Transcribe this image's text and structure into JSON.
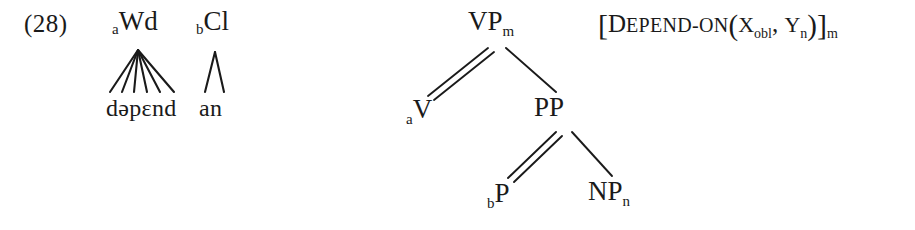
{
  "example": {
    "number_label": "(28)"
  },
  "prosodic_structure": {
    "nodes": [
      {
        "name": "wd",
        "prefix_subscript": "a",
        "label": "Wd",
        "dominates": "depend"
      },
      {
        "name": "cl",
        "prefix_subscript": "b",
        "label": "Cl",
        "dominates": "an"
      }
    ],
    "segment_strings": [
      {
        "name": "depend",
        "text": "dəpɛnd",
        "segments": [
          "d",
          "ə",
          "p",
          "ɛ",
          "n",
          "d"
        ],
        "line_count": 6
      },
      {
        "name": "an",
        "text": "an",
        "segments": [
          "a",
          "n"
        ],
        "line_count": 2
      }
    ]
  },
  "syntax_tree": {
    "nodes": [
      {
        "id": "vp",
        "prefix_subscript": "",
        "label": "VP",
        "subscript": "m"
      },
      {
        "id": "v",
        "prefix_subscript": "a",
        "label": "V",
        "subscript": ""
      },
      {
        "id": "pp",
        "prefix_subscript": "",
        "label": "PP",
        "subscript": ""
      },
      {
        "id": "p",
        "prefix_subscript": "b",
        "label": "P",
        "subscript": ""
      },
      {
        "id": "np",
        "prefix_subscript": "",
        "label": "NP",
        "subscript": "n"
      }
    ],
    "edges": [
      {
        "from": "vp",
        "to": "v",
        "style": "double"
      },
      {
        "from": "vp",
        "to": "pp",
        "style": "single"
      },
      {
        "from": "pp",
        "to": "p",
        "style": "double"
      },
      {
        "from": "pp",
        "to": "np",
        "style": "single"
      }
    ]
  },
  "semantics": {
    "open_bracket": "[",
    "predicate_initial": "D",
    "predicate_rest": "EPEND-ON",
    "open_paren": "(",
    "arg1_var": "X",
    "arg1_sub": "obl",
    "separator": ", ",
    "arg2_var": "Y",
    "arg2_sub": "n",
    "close_paren": ")",
    "close_bracket": "]",
    "outer_subscript": "m"
  },
  "colors": {
    "ink": "#1a1a1a",
    "background": "#ffffff"
  }
}
